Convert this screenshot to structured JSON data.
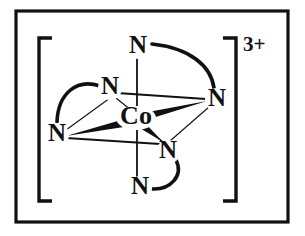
{
  "figure": {
    "frame": {
      "visible": true,
      "color": "#111111"
    },
    "bracket": {
      "left": "[",
      "right": "]",
      "color": "#111111"
    },
    "charge": "3+",
    "metal": {
      "symbol": "Co",
      "x": 136,
      "y": 118
    },
    "donor_atoms": [
      {
        "id": "n-top",
        "symbol": "N",
        "x": 138,
        "y": 47,
        "position": "top-axial"
      },
      {
        "id": "n-upper-left",
        "symbol": "N",
        "x": 110,
        "y": 88,
        "position": "upper-left-equatorial"
      },
      {
        "id": "n-right",
        "symbol": "N",
        "x": 217,
        "y": 100,
        "position": "right-equatorial"
      },
      {
        "id": "n-lower-left",
        "symbol": "N",
        "x": 57,
        "y": 135,
        "position": "left-equatorial"
      },
      {
        "id": "n-lower-inner",
        "symbol": "N",
        "x": 168,
        "y": 152,
        "position": "lower-right-equatorial"
      },
      {
        "id": "n-bottom",
        "symbol": "N",
        "x": 140,
        "y": 188,
        "position": "bottom-axial"
      }
    ],
    "chelate_bridges": [
      {
        "from": "n-top",
        "to": "n-right",
        "style": "arc"
      },
      {
        "from": "n-upper-left",
        "to": "n-lower-left",
        "style": "arc"
      },
      {
        "from": "n-lower-inner",
        "to": "n-bottom",
        "style": "arc"
      }
    ],
    "bonds": [
      {
        "from": "metal",
        "to": "n-top",
        "style": "plain"
      },
      {
        "from": "metal",
        "to": "n-bottom",
        "style": "plain"
      },
      {
        "from": "metal",
        "to": "n-upper-left",
        "style": "plain"
      },
      {
        "from": "metal",
        "to": "n-lower-left",
        "style": "wedge"
      },
      {
        "from": "metal",
        "to": "n-right",
        "style": "wedge"
      },
      {
        "from": "metal",
        "to": "n-lower-inner",
        "style": "wedge"
      }
    ],
    "octahedron_edges": [
      {
        "from": "n-upper-left",
        "to": "n-lower-left"
      },
      {
        "from": "n-upper-left",
        "to": "n-right"
      },
      {
        "from": "n-lower-left",
        "to": "n-lower-inner"
      },
      {
        "from": "n-right",
        "to": "n-lower-inner"
      }
    ]
  }
}
